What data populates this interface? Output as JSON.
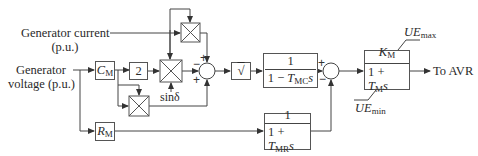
{
  "diagram": {
    "type": "block-diagram",
    "inputs": {
      "current_label_line1": "Generator current",
      "current_label_line2": "(p.u.)",
      "voltage_label_line1": "Generator",
      "voltage_label_line2": "voltage (p.u.)"
    },
    "blocks": {
      "cm": {
        "symbol": "C",
        "sub": "M"
      },
      "gain2": {
        "value": "2"
      },
      "rm": {
        "symbol": "R",
        "sub": "M"
      },
      "sqrt": {
        "symbol": "√"
      },
      "lead": {
        "num": "1",
        "den_prefix": "1 − ",
        "den_T": "T",
        "den_sub": "MC",
        "den_s": "s"
      },
      "lag_r": {
        "num": "1",
        "den_prefix": "1 + ",
        "den_T": "T",
        "den_sub": "MR",
        "den_s": "s"
      },
      "main": {
        "num_K": "K",
        "num_sub": "M",
        "den_prefix": "1 + ",
        "den_T": "T",
        "den_sub": "M",
        "den_s": "s"
      }
    },
    "multipliers": {
      "top": {
        "symbol": "×"
      },
      "middle": {
        "symbol": "×",
        "extra_input": "sinδ"
      },
      "bottom": {
        "symbol": "×"
      }
    },
    "junctions": {
      "sum1": {
        "signs": {
          "top": "+",
          "left": "−",
          "bottom": "+"
        }
      },
      "sum2": {
        "signs": {
          "left_top": "+",
          "left_bottom": "−"
        }
      }
    },
    "limits": {
      "max_base": "UE",
      "max_sub": "max",
      "min_base": "UE",
      "min_sub": "min"
    },
    "output": {
      "label": "To AVR"
    },
    "colors": {
      "line": "#444444",
      "box_border": "#555555",
      "text": "#2a2a2a",
      "background": "#ffffff"
    }
  }
}
